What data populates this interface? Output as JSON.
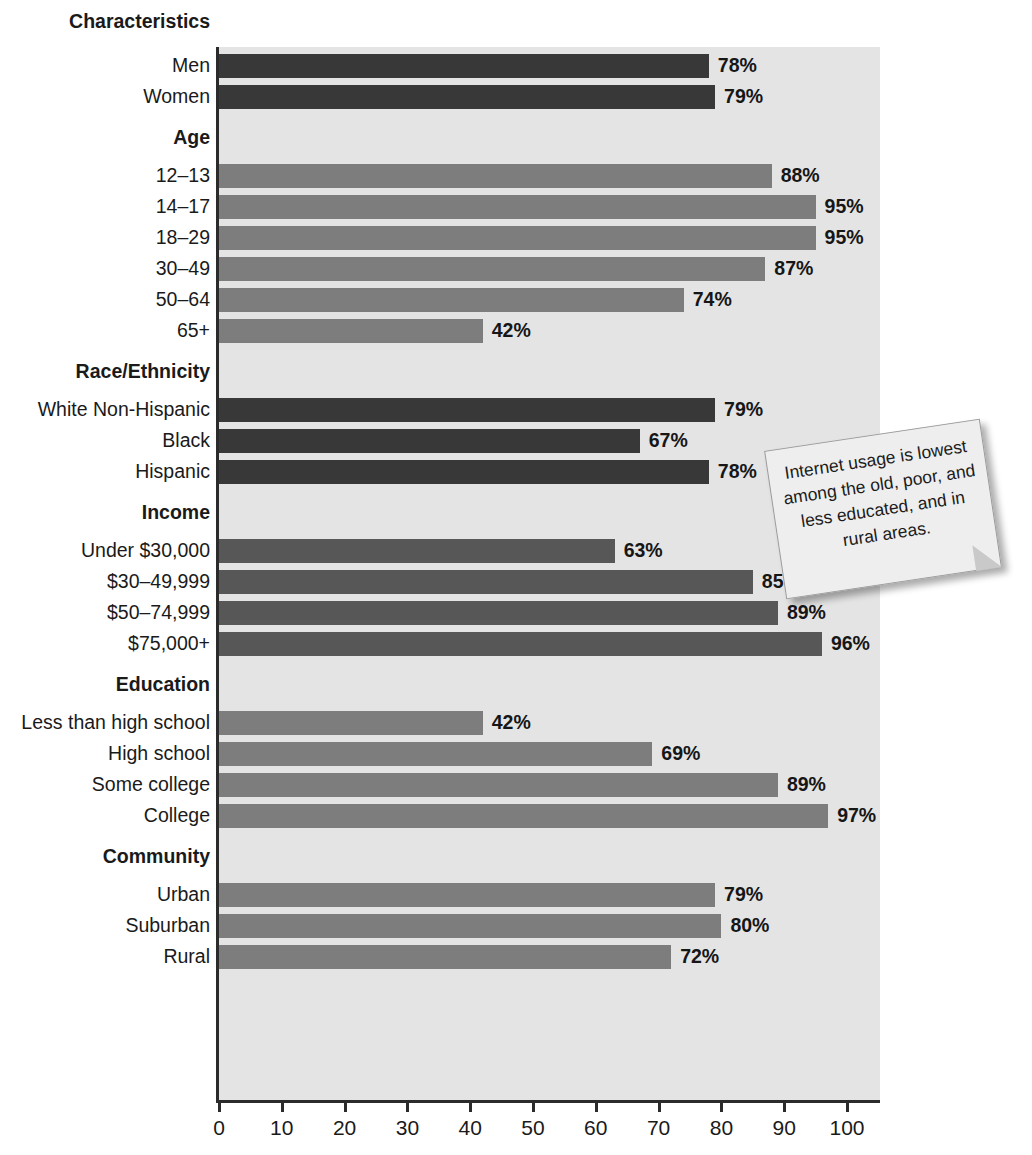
{
  "chart_data": {
    "type": "bar",
    "orientation": "horizontal",
    "title": "",
    "xlabel": "",
    "ylabel": "",
    "xlim": [
      0,
      107
    ],
    "xticks": [
      0,
      10,
      20,
      30,
      40,
      50,
      60,
      70,
      80,
      90,
      100
    ],
    "grid": false,
    "legend": "none",
    "value_suffix": "%",
    "groups": [
      {
        "heading": "Characteristics",
        "heading_position": "outside-top",
        "tone": "dark",
        "categories": [
          "Men",
          "Women"
        ],
        "values": [
          78,
          79
        ],
        "labels": [
          "78%",
          "79%"
        ]
      },
      {
        "heading": "Age",
        "tone": "light",
        "categories": [
          "12–13",
          "14–17",
          "18–29",
          "30–49",
          "50–64",
          "65+"
        ],
        "values": [
          88,
          95,
          95,
          87,
          74,
          42
        ],
        "labels": [
          "88%",
          "95%",
          "95%",
          "87%",
          "74%",
          "42%"
        ]
      },
      {
        "heading": "Race/Ethnicity",
        "tone": "dark",
        "categories": [
          "White Non-Hispanic",
          "Black",
          "Hispanic"
        ],
        "values": [
          79,
          67,
          78
        ],
        "labels": [
          "79%",
          "67%",
          "78%"
        ]
      },
      {
        "heading": "Income",
        "tone": "mid",
        "categories": [
          "Under $30,000",
          "$30–49,999",
          "$50–74,999",
          "$75,000+"
        ],
        "values": [
          63,
          85,
          89,
          96
        ],
        "labels": [
          "63%",
          "85%",
          "89%",
          "96%"
        ]
      },
      {
        "heading": "Education",
        "tone": "light",
        "categories": [
          "Less than high school",
          "High school",
          "Some college",
          "College"
        ],
        "values": [
          42,
          69,
          89,
          97
        ],
        "labels": [
          "42%",
          "69%",
          "89%",
          "97%"
        ]
      },
      {
        "heading": "Community",
        "tone": "light",
        "categories": [
          "Urban",
          "Suburban",
          "Rural"
        ],
        "values": [
          79,
          80,
          72
        ],
        "labels": [
          "79%",
          "80%",
          "72%"
        ]
      }
    ]
  },
  "annotation": {
    "text": "Internet usage is lowest among the old, poor, and less educated, and in rural areas."
  },
  "colors": {
    "bar_dark": "#383838",
    "bar_mid": "#575757",
    "bar_light": "#7d7d7d",
    "plot_background": "#e4e4e4",
    "axis": "#2b2b2b",
    "note_background": "#eeeeee"
  }
}
